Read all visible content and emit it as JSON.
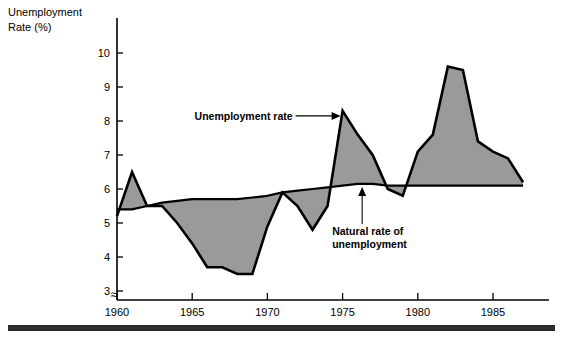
{
  "chart_data": {
    "type": "area",
    "title": "",
    "ylabel": "Unemployment Rate (%)",
    "xlabel": "",
    "ylim": [
      3,
      10.4
    ],
    "xlim": [
      1960,
      1987.3
    ],
    "grid": false,
    "legend_position": "annotations-inline",
    "y_ticks": [
      3,
      4,
      5,
      6,
      7,
      8,
      9,
      10
    ],
    "y_tick_labels": [
      "3",
      "4",
      "5",
      "6",
      "7",
      "8",
      "9",
      "10"
    ],
    "x_ticks": [
      1960,
      1965,
      1970,
      1975,
      1980,
      1985
    ],
    "x_tick_labels": [
      "1960",
      "1965",
      "1970",
      "1975",
      "1980",
      "1985"
    ],
    "axis_break_symbol": "≈",
    "x": [
      1960,
      1961,
      1962,
      1963,
      1964,
      1965,
      1966,
      1967,
      1968,
      1969,
      1970,
      1971,
      1972,
      1973,
      1974,
      1975,
      1976,
      1977,
      1978,
      1979,
      1980,
      1981,
      1982,
      1983,
      1984,
      1985,
      1986,
      1987
    ],
    "series": [
      {
        "name": "Unemployment rate",
        "values": [
          5.2,
          6.5,
          5.5,
          5.5,
          5.0,
          4.4,
          3.7,
          3.7,
          3.5,
          3.5,
          4.9,
          5.9,
          5.5,
          4.8,
          5.5,
          8.3,
          7.6,
          7.0,
          6.0,
          5.8,
          7.1,
          7.6,
          9.6,
          9.5,
          7.4,
          7.1,
          6.9,
          6.2
        ]
      },
      {
        "name": "Natural rate of unemployment",
        "values": [
          5.4,
          5.4,
          5.5,
          5.6,
          5.65,
          5.7,
          5.7,
          5.7,
          5.7,
          5.75,
          5.8,
          5.9,
          5.95,
          6.0,
          6.05,
          6.1,
          6.15,
          6.15,
          6.1,
          6.1,
          6.1,
          6.1,
          6.1,
          6.1,
          6.1,
          6.1,
          6.1,
          6.1
        ]
      }
    ],
    "annotations": [
      {
        "id": "unemployment-rate-annotation",
        "text": "Unemployment rate",
        "target_year": 1975,
        "target_value": 8.15,
        "pointer": "right-arrow"
      },
      {
        "id": "natural-rate-annotation",
        "text_line_1": "Natural rate of",
        "text_line_2": "unemployment",
        "target_year": 1976.3,
        "target_value": 6.15,
        "pointer": "up-arrow"
      }
    ],
    "colors": {
      "fill": "#9a9a9a",
      "line": "#000000",
      "background": "#ffffff",
      "baseline_rule": "#2b2b2b"
    }
  }
}
